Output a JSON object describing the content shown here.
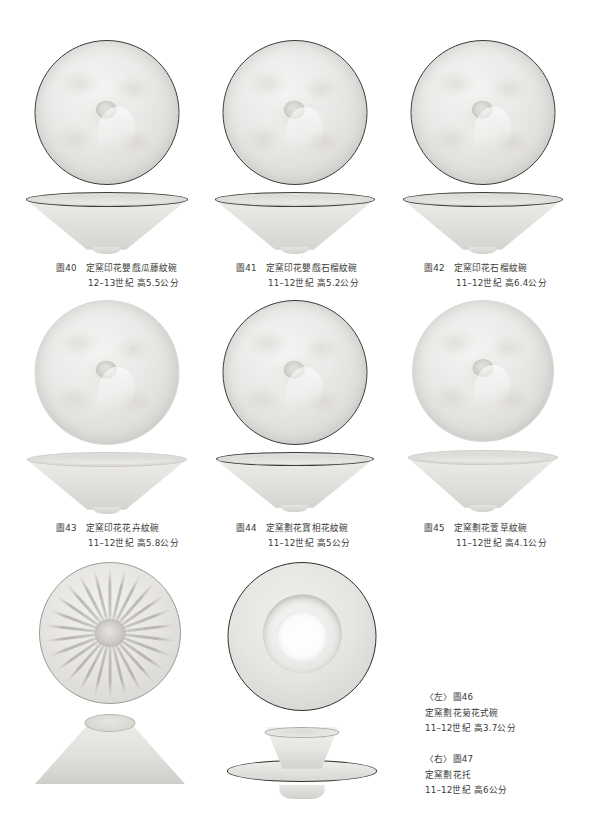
{
  "page": {
    "kind": "museum-catalogue-plate-page",
    "background": "#ffffff"
  },
  "figures": [
    {
      "id": "fig40",
      "number": "圖40",
      "title": "定窯印花嬰戲瓜藤紋碗",
      "detail": "12–13世紀 高5.5公分",
      "views": [
        "top-interior",
        "profile"
      ],
      "rim": "dark"
    },
    {
      "id": "fig41",
      "number": "圖41",
      "title": "定窯印花嬰戲石榴紋碗",
      "detail": "11–12世紀 高5.2公分",
      "views": [
        "top-interior",
        "profile"
      ],
      "rim": "dark"
    },
    {
      "id": "fig42",
      "number": "圖42",
      "title": "定窯印花石榴紋碗",
      "detail": "11–12世紀 高6.4公分",
      "views": [
        "top-interior",
        "profile"
      ],
      "rim": "dark"
    },
    {
      "id": "fig43",
      "number": "圖43",
      "title": "定窯印花花卉紋碗",
      "detail": "11–12世紀 高5.8公分",
      "views": [
        "top-interior",
        "profile"
      ],
      "rim": "light"
    },
    {
      "id": "fig44",
      "number": "圖44",
      "title": "定窯劃花寶相花紋碗",
      "detail": "11–12世紀 高5公分",
      "views": [
        "top-interior",
        "profile"
      ],
      "rim": "dark"
    },
    {
      "id": "fig45",
      "number": "圖45",
      "title": "定窯劃花萱草紋碗",
      "detail": "11–12世紀 高4.1公分",
      "views": [
        "top-interior",
        "profile"
      ],
      "rim": "light"
    }
  ],
  "bottom": {
    "left_figure": {
      "id": "fig46",
      "position_label": "〈左〉",
      "number": "圖46",
      "title": "定窯劃花菊花式碗",
      "detail": "11–12世紀 高3.7公分",
      "views": [
        "top-chrysanthemum",
        "profile-inverted-cone"
      ]
    },
    "right_figure": {
      "id": "fig47",
      "position_label": "〈右〉",
      "number": "圖47",
      "title": "定窯劃花托",
      "detail": "11–12世紀 高6公分",
      "views": [
        "top-ring",
        "profile-cup-stand"
      ]
    }
  }
}
